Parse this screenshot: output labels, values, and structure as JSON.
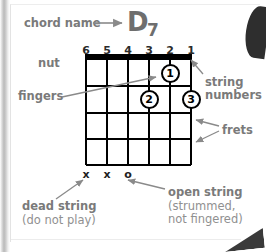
{
  "chord": {
    "root": "D",
    "quality": "7",
    "full_name": "D7"
  },
  "annotations": {
    "chord_name": "chord name",
    "nut": "nut",
    "fingers": "fingers",
    "string_numbers_line1": "string",
    "string_numbers_line2": "numbers",
    "frets": "frets",
    "dead_string_title": "dead string",
    "dead_string_note": "(do not play)",
    "open_string_title": "open string",
    "open_string_note_line1": "(strummed,",
    "open_string_note_line2": "not fingered)"
  },
  "chart_data": {
    "type": "diagram",
    "title": "D7",
    "instrument": "guitar",
    "string_count": 6,
    "fret_count": 4,
    "string_numbers": [
      "6",
      "5",
      "4",
      "3",
      "2",
      "1"
    ],
    "nut_shown": true,
    "finger_positions": [
      {
        "label": "1",
        "string": 2,
        "fret": 1
      },
      {
        "label": "2",
        "string": 3,
        "fret": 2
      },
      {
        "label": "3",
        "string": 1,
        "fret": 2
      }
    ],
    "open_or_muted": [
      {
        "string": 6,
        "marker": "x"
      },
      {
        "string": 5,
        "marker": "x"
      },
      {
        "string": 4,
        "marker": "o"
      },
      {
        "string": 3,
        "marker": ""
      },
      {
        "string": 2,
        "marker": ""
      },
      {
        "string": 1,
        "marker": ""
      }
    ]
  },
  "colors": {
    "label_gray": "#7a7a7a",
    "label_gray_light": "#909090",
    "chord_name_gray": "#6e6e6e",
    "grid_black": "#000000",
    "page_white": "#ffffff"
  }
}
